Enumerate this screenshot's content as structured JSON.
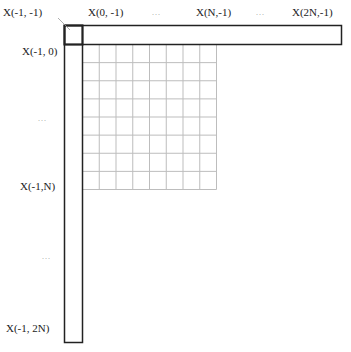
{
  "diagram": {
    "type": "reference-sample-layout",
    "grid": {
      "rows": 8,
      "cols": 8,
      "line_color": "#bdbdbd"
    },
    "border_color": "#222222",
    "labels": {
      "corner": "X(-1,  -1)",
      "top_0": "X(0,  -1)",
      "top_dots_1": "...",
      "top_n": "X(N,-1)",
      "top_dots_2": "...",
      "top_2n": "X(2N,-1)",
      "left_0": "X(-1,  0)",
      "left_dots_1": "...",
      "left_n": "X(-1,N)",
      "left_dots_2": "...",
      "left_2n": "X(-1,  2N)"
    }
  }
}
